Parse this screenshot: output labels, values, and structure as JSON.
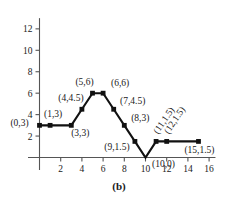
{
  "chart_data": {
    "type": "line",
    "title": "",
    "subtitle": "",
    "caption": "(b)",
    "xlabel": "",
    "ylabel": "",
    "xlim": [
      0,
      16.6
    ],
    "ylim": [
      0,
      13
    ],
    "grid": false,
    "legend": null,
    "x_ticks": [
      "2",
      "4",
      "6",
      "8",
      "10",
      "12",
      "14",
      "16"
    ],
    "x_tick_values": [
      2,
      4,
      6,
      8,
      10,
      12,
      14,
      16
    ],
    "y_ticks": [
      "2",
      "4",
      "6",
      "8",
      "10",
      "12"
    ],
    "y_tick_values": [
      2,
      4,
      6,
      8,
      10,
      12
    ],
    "marker": "square",
    "series": [
      {
        "name": "piecewise-linear",
        "x": [
          0,
          1,
          3,
          4,
          5,
          6,
          7,
          8,
          9,
          10,
          11,
          12,
          15
        ],
        "y": [
          3,
          3,
          3,
          4.5,
          6,
          6,
          4.5,
          3,
          1.5,
          0,
          1.5,
          1.5,
          1.5
        ]
      }
    ],
    "point_labels": [
      {
        "text": "(0,3)",
        "x": 0,
        "y": 3,
        "dx": -20,
        "dy": 1,
        "anchor": "middle",
        "rotate": 0
      },
      {
        "text": "(1,3)",
        "x": 1,
        "y": 3,
        "dx": 3,
        "dy": -8,
        "anchor": "middle",
        "rotate": 0
      },
      {
        "text": "(3,3)",
        "x": 3,
        "y": 3,
        "dx": 9,
        "dy": 11,
        "anchor": "middle",
        "rotate": 0
      },
      {
        "text": "(4,4.5)",
        "x": 4,
        "y": 4.5,
        "dx": -11,
        "dy": -8,
        "anchor": "middle",
        "rotate": 0
      },
      {
        "text": "(5,6)",
        "x": 5,
        "y": 6,
        "dx": -8,
        "dy": -8,
        "anchor": "middle",
        "rotate": 0
      },
      {
        "text": "(6,6)",
        "x": 6,
        "y": 6,
        "dx": 17,
        "dy": -7,
        "anchor": "middle",
        "rotate": 0
      },
      {
        "text": "(7,4.5)",
        "x": 7,
        "y": 4.5,
        "dx": 19,
        "dy": -5,
        "anchor": "middle",
        "rotate": 0
      },
      {
        "text": "(8,3)",
        "x": 8,
        "y": 3,
        "dx": 16,
        "dy": -4,
        "anchor": "middle",
        "rotate": 0
      },
      {
        "text": "(9,1.5)",
        "x": 9,
        "y": 1.5,
        "dx": -18,
        "dy": 9,
        "anchor": "middle",
        "rotate": 0
      },
      {
        "text": "(10,0)",
        "x": 10,
        "y": 0,
        "dx": 18,
        "dy": 9,
        "anchor": "middle",
        "rotate": 0
      },
      {
        "text": "(11,1.5)",
        "x": 11,
        "y": 1.5,
        "dx": 2,
        "dy": -7,
        "anchor": "start",
        "rotate": -56
      },
      {
        "text": "(12,1.5)",
        "x": 12,
        "y": 1.5,
        "dx": 2,
        "dy": -7,
        "anchor": "start",
        "rotate": -56
      },
      {
        "text": "(15,1.5)",
        "x": 15,
        "y": 1.5,
        "dx": 1,
        "dy": 12,
        "anchor": "middle",
        "rotate": 0
      }
    ]
  },
  "figure": {
    "caption": "(b)"
  }
}
